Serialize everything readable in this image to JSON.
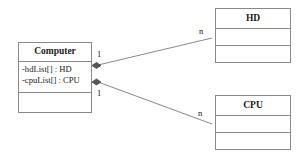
{
  "diagram": {
    "type": "uml-class-diagram",
    "background_color": "#ffffff",
    "line_color": "#8a8a8a",
    "text_color": "#1a1a1a"
  },
  "classes": {
    "computer": {
      "name": "Computer",
      "attributes": [
        "-hdList[] : HD",
        "-cpuList[] : CPU"
      ],
      "operations": []
    },
    "hd": {
      "name": "HD",
      "attributes": [],
      "operations": []
    },
    "cpu": {
      "name": "CPU",
      "attributes": [],
      "operations": []
    }
  },
  "relationships": [
    {
      "id": "computer-hd",
      "kind": "composition",
      "from": "Computer",
      "to": "HD",
      "source_multiplicity": "1",
      "target_multiplicity": "n",
      "diamond_filled": true
    },
    {
      "id": "computer-cpu",
      "kind": "composition",
      "from": "Computer",
      "to": "CPU",
      "source_multiplicity": "1",
      "target_multiplicity": "n",
      "diamond_filled": true
    }
  ]
}
